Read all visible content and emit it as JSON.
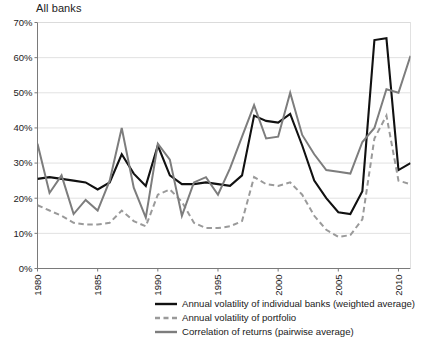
{
  "title": "All banks",
  "legend": {
    "items": [
      {
        "label": "Annual volatility of individual banks (weighted average)",
        "style": "solid",
        "color": "#111111",
        "width": 2.4,
        "key": "individual"
      },
      {
        "label": "Annual volatility of portfolio",
        "style": "dashed",
        "color": "#9a9a9a",
        "width": 2.4,
        "key": "portfolio"
      },
      {
        "label": "Correlation of returns (pairwise average)",
        "style": "solid",
        "color": "#7d7d7d",
        "width": 2.4,
        "key": "correlation"
      }
    ]
  },
  "chart_data": {
    "type": "line",
    "title": "All banks",
    "xlabel": "",
    "ylabel": "",
    "xlim": [
      1980,
      2011
    ],
    "ylim": [
      0,
      70
    ],
    "grid": true,
    "grid_axis": "y",
    "legend_position": "bottom",
    "ytick_labels": [
      "0%",
      "10%",
      "20%",
      "30%",
      "40%",
      "50%",
      "60%",
      "70%"
    ],
    "ytick_values": [
      0,
      10,
      20,
      30,
      40,
      50,
      60,
      70
    ],
    "xtick_labels": [
      "1980",
      "1985",
      "1990",
      "1995",
      "2000",
      "2005",
      "2010"
    ],
    "xtick_values": [
      1980,
      1985,
      1990,
      1995,
      2000,
      2005,
      2010
    ],
    "x": [
      1980,
      1981,
      1982,
      1983,
      1984,
      1985,
      1986,
      1987,
      1988,
      1989,
      1990,
      1991,
      1992,
      1993,
      1994,
      1995,
      1996,
      1997,
      1998,
      1999,
      2000,
      2001,
      2002,
      2003,
      2004,
      2005,
      2006,
      2007,
      2008,
      2009,
      2010,
      2011
    ],
    "series": [
      {
        "name": "Annual volatility of individual banks (weighted average)",
        "key": "individual",
        "style": "solid",
        "color": "#111111",
        "values": [
          25.5,
          26.0,
          25.5,
          25.0,
          24.5,
          22.5,
          24.5,
          32.5,
          27.0,
          23.5,
          35.0,
          26.5,
          24.0,
          24.0,
          24.5,
          24.0,
          23.5,
          26.5,
          43.5,
          42.0,
          41.5,
          44.0,
          35.0,
          25.0,
          20.0,
          16.0,
          15.5,
          22.0,
          65.0,
          65.5,
          28.0,
          30.0
        ]
      },
      {
        "name": "Annual volatility of portfolio",
        "key": "portfolio",
        "style": "dashed",
        "color": "#9a9a9a",
        "values": [
          18.0,
          16.5,
          15.0,
          13.0,
          12.5,
          12.5,
          13.0,
          16.5,
          13.5,
          12.0,
          21.0,
          22.5,
          19.0,
          13.0,
          11.5,
          11.5,
          12.0,
          13.5,
          26.0,
          24.0,
          23.5,
          24.5,
          21.0,
          15.0,
          11.0,
          9.0,
          9.5,
          14.0,
          37.0,
          43.5,
          25.0,
          24.0
        ]
      },
      {
        "name": "Correlation of returns (pairwise average)",
        "key": "correlation",
        "style": "solid",
        "color": "#7d7d7d",
        "values": [
          35.5,
          21.5,
          26.5,
          15.5,
          19.5,
          16.5,
          25.0,
          40.0,
          23.0,
          14.5,
          35.5,
          31.0,
          15.0,
          24.5,
          26.0,
          21.0,
          28.5,
          37.5,
          46.5,
          37.0,
          37.5,
          50.0,
          38.0,
          32.5,
          28.0,
          27.5,
          27.0,
          36.0,
          40.0,
          51.0,
          50.0,
          60.5
        ]
      }
    ]
  }
}
